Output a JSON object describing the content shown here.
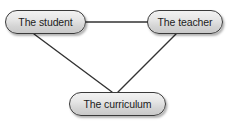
{
  "diagram": {
    "background_color": "#ffffff",
    "node_fill_top": "#f2f2f2",
    "node_fill_bottom": "#c9c9c9",
    "node_border_color": "#3a3a3a",
    "edge_color": "#333333",
    "text_color": "#1b1b1b",
    "nodes": [
      {
        "id": "student",
        "label": "The student",
        "x": 5,
        "y": 10,
        "width": 81,
        "height": 24
      },
      {
        "id": "teacher",
        "label": "The teacher",
        "x": 147,
        "y": 10,
        "width": 76,
        "height": 24
      },
      {
        "id": "curriculum",
        "label": "The curriculum",
        "x": 69,
        "y": 92,
        "width": 97,
        "height": 24
      }
    ],
    "edges": [
      {
        "id": "student-teacher",
        "from": "student",
        "to": "teacher",
        "x1": 86,
        "y1": 22,
        "x2": 147,
        "y2": 22
      },
      {
        "id": "student-curriculum",
        "from": "student",
        "to": "curriculum",
        "x1": 34,
        "y1": 34,
        "x2": 112,
        "y2": 92
      },
      {
        "id": "teacher-curriculum",
        "from": "teacher",
        "to": "curriculum",
        "x1": 176,
        "y1": 34,
        "x2": 117,
        "y2": 92
      }
    ]
  }
}
